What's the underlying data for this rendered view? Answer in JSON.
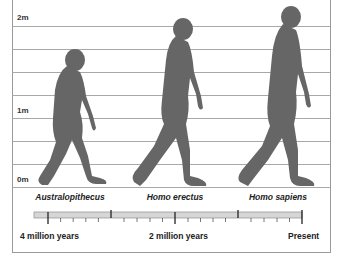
{
  "diagram": {
    "type": "human-evolution-height-comparison",
    "height_scale": {
      "labels": [
        "2m",
        "1m",
        "0m"
      ],
      "gridline_count": 8
    },
    "species": [
      {
        "name": "Australopithecus"
      },
      {
        "name": "Homo erectus"
      },
      {
        "name": "Homo sapiens"
      }
    ],
    "timeline": {
      "labels": {
        "start": "4 million years",
        "middle": "2 million years",
        "end": "Present"
      }
    },
    "colors": {
      "silhouette": "#666666",
      "gridline": "#a8a8a8",
      "timeline_bar": "#d6d6d6",
      "border": "#9a9a9a"
    }
  }
}
